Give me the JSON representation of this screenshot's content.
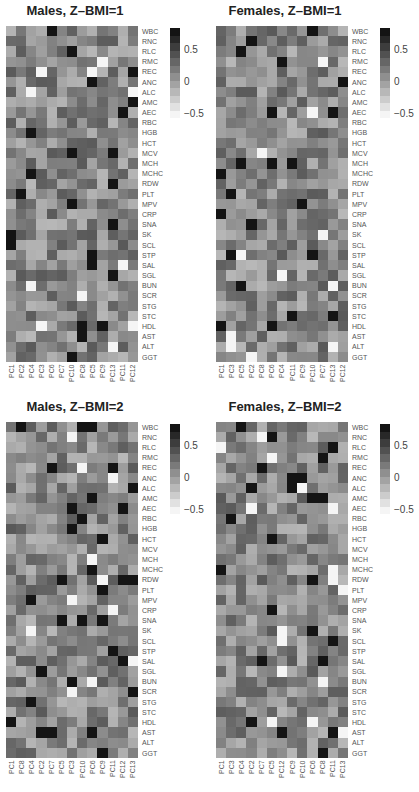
{
  "chart_data": [
    {
      "type": "heatmap",
      "title": "Males, Z–BMI=1",
      "rows": [
        "WBC",
        "RNC",
        "RLC",
        "RMC",
        "REC",
        "ANC",
        "ALC",
        "AMC",
        "AEC",
        "RBC",
        "HGB",
        "HCT",
        "MCV",
        "MCH",
        "MCHC",
        "RDW",
        "PLT",
        "MPV",
        "CRP",
        "SNA",
        "SK",
        "SCL",
        "STP",
        "SAL",
        "SGL",
        "BUN",
        "SCR",
        "STG",
        "STC",
        "HDL",
        "AST",
        "ALT",
        "GGT"
      ],
      "columns": [
        "PC1",
        "PC2",
        "PC4",
        "PC3",
        "PC6",
        "PC7",
        "PC10",
        "PC8",
        "PC5",
        "PC9",
        "PC13",
        "PC11",
        "PC12"
      ],
      "colorbar": {
        "min": -0.5,
        "max": 0.8,
        "ticks": [
          "0.5",
          "0",
          "−0.5"
        ]
      }
    },
    {
      "type": "heatmap",
      "title": "Females, Z–BMI=1",
      "rows": [
        "WBC",
        "RNC",
        "RLC",
        "RMC",
        "REC",
        "ANC",
        "ALC",
        "AMC",
        "AEC",
        "RBC",
        "HGB",
        "HCT",
        "MCV",
        "MCH",
        "MCHC",
        "RDW",
        "PLT",
        "MPV",
        "CRP",
        "SNA",
        "SK",
        "SCL",
        "STP",
        "SAL",
        "SGL",
        "BUN",
        "SCR",
        "STG",
        "STC",
        "HDL",
        "AST",
        "ALT",
        "GGT"
      ],
      "columns": [
        "PC1",
        "PC3",
        "PC5",
        "PC2",
        "PC8",
        "PC6",
        "PC4",
        "PC11",
        "PC9",
        "PC10",
        "PC7",
        "PC13",
        "PC12"
      ],
      "colorbar": {
        "min": -0.5,
        "max": 0.8,
        "ticks": [
          "0.5",
          "0",
          "−0.5"
        ]
      }
    },
    {
      "type": "heatmap",
      "title": "Males, Z–BMI=2",
      "rows": [
        "WBC",
        "RNC",
        "RLC",
        "RMC",
        "REC",
        "ANC",
        "ALC",
        "AMC",
        "AEC",
        "RBC",
        "HGB",
        "HCT",
        "MCV",
        "MCH",
        "MCHC",
        "RDW",
        "PLT",
        "MPV",
        "CRP",
        "SNA",
        "SK",
        "SCL",
        "STP",
        "SAL",
        "SGL",
        "BUN",
        "SCR",
        "STG",
        "STC",
        "HDL",
        "AST",
        "ALT",
        "GGT"
      ],
      "columns": [
        "PC1",
        "PC8",
        "PC4",
        "PC2",
        "PC7",
        "PC5",
        "PC3",
        "PC10",
        "PC6",
        "PC9",
        "PC11",
        "PC12",
        "PC13"
      ],
      "colorbar": {
        "min": -0.5,
        "max": 0.8,
        "ticks": [
          "0.5",
          "0",
          "−0.5"
        ]
      }
    },
    {
      "type": "heatmap",
      "title": "Females, Z–BMI=2",
      "rows": [
        "WBC",
        "RNC",
        "RLC",
        "RMC",
        "REC",
        "ANC",
        "ALC",
        "AMC",
        "AEC",
        "RBC",
        "HGB",
        "HCT",
        "MCV",
        "MCH",
        "MCHC",
        "RDW",
        "PLT",
        "MPV",
        "CRP",
        "SNA",
        "SK",
        "SCL",
        "STP",
        "SAL",
        "SGL",
        "BUN",
        "SCR",
        "STG",
        "STC",
        "HDL",
        "AST",
        "ALT",
        "GGT"
      ],
      "columns": [
        "PC1",
        "PC3",
        "PC4",
        "PC2",
        "PC7",
        "PC5",
        "PC12",
        "PC9",
        "PC10",
        "PC6",
        "PC8",
        "PC11",
        "PC13"
      ],
      "colorbar": {
        "min": -0.5,
        "max": 0.8,
        "ticks": [
          "0.5",
          "0",
          "−0.5"
        ]
      }
    }
  ],
  "panels": [
    {
      "title": "Males, Z–BMI=1"
    },
    {
      "title": "Females, Z–BMI=1"
    },
    {
      "title": "Males, Z–BMI=2"
    },
    {
      "title": "Females, Z–BMI=2"
    }
  ],
  "colorbar_ticks": [
    "0.5",
    "0",
    "−0.5"
  ]
}
